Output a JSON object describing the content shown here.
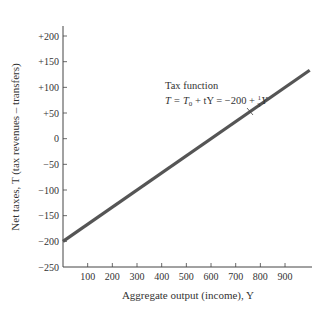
{
  "chart_data": {
    "type": "line",
    "title": "",
    "xlabel": "Aggregate output (income), Y",
    "ylabel": "Net taxes, T (tax revenues – transfers)",
    "xlim": [
      0,
      1000
    ],
    "ylim": [
      -250,
      250
    ],
    "x_ticks": [
      100,
      200,
      300,
      400,
      500,
      600,
      700,
      800,
      900
    ],
    "x_tick_labels": [
      "100",
      "200",
      "300",
      "400",
      "500",
      "600",
      "700",
      "800",
      "900"
    ],
    "y_ticks": [
      200,
      150,
      100,
      50,
      0,
      -50,
      -100,
      -150,
      -200,
      -250
    ],
    "y_tick_labels": [
      "+200",
      "+150",
      "+100",
      "+50",
      "0",
      "−50",
      "−100",
      "−150",
      "−200",
      "−250"
    ],
    "grid": false,
    "series": [
      {
        "name": "Tax function",
        "equation": "T = -200 + (1/3)Y",
        "x": [
          0,
          1000
        ],
        "values": [
          -200,
          133.3
        ],
        "color": "#555555"
      }
    ],
    "annotations": [
      {
        "line1": "Tax function",
        "line2_prefix": "T = T",
        "line2_sub": "0",
        "line2_mid": " + tY = −200 + ",
        "frac_num": "1",
        "frac_den": "3",
        "line2_suffix": "Y",
        "points_to": [
          800,
          67
        ]
      }
    ]
  }
}
